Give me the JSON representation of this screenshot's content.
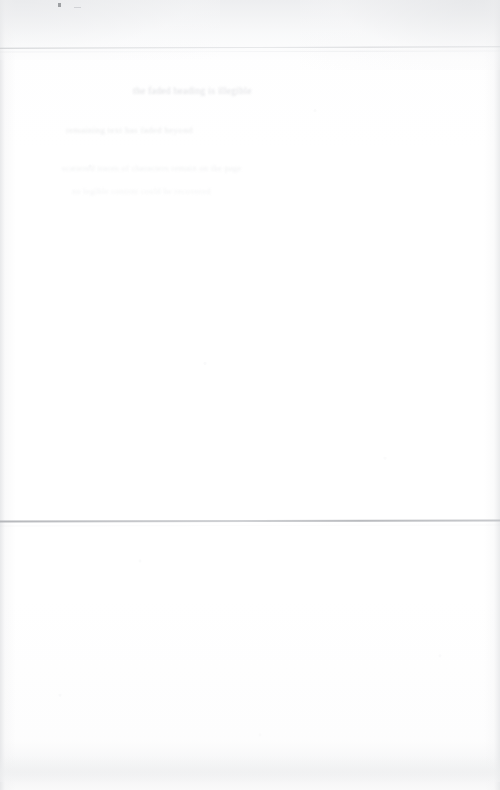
{
  "page": {
    "kind": "scanned-document-page",
    "background_color": "#ffffff",
    "width": 500,
    "height": 790
  },
  "rules": {
    "top": {
      "name": "top-horizontal-rule",
      "color": "#c4c6c9",
      "y": 47
    },
    "top_echo": {
      "name": "top-horizontal-rule-echo",
      "color": "#d8dadd",
      "y": 51
    },
    "middle": {
      "name": "middle-horizontal-rule",
      "color": "#b0b2b6",
      "y": 520
    },
    "middle_echo": {
      "name": "middle-horizontal-rule-echo",
      "color": "#d6d8db",
      "y": 525
    }
  },
  "ghost_text": {
    "heading": "the faded heading is illegible",
    "body_1": "remaining text has faded beyond",
    "body_2": "scattered traces of characters remain on the page",
    "body_3": "no legible content could be recovered"
  },
  "artifacts": {
    "speck_label": "scan-speck",
    "speck_color": "#8a8c90",
    "edge_shadow_color": "#e4e5e7",
    "bottom_band_color": "#eeeff0"
  },
  "caption": "A heavily faded scanned document page. Two faint horizontal rules cross the sheet; all body text has washed out to illegibility."
}
